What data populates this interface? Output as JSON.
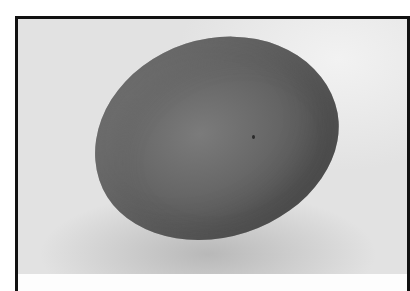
{
  "image": {
    "subject": "egg",
    "description": "Grayscale photograph of a single egg on a light background, inside a black frame",
    "colors": {
      "frame": "#111111",
      "background": "#e4e4e4",
      "egg": "#666666",
      "shadow": "#9a9a9a"
    }
  }
}
